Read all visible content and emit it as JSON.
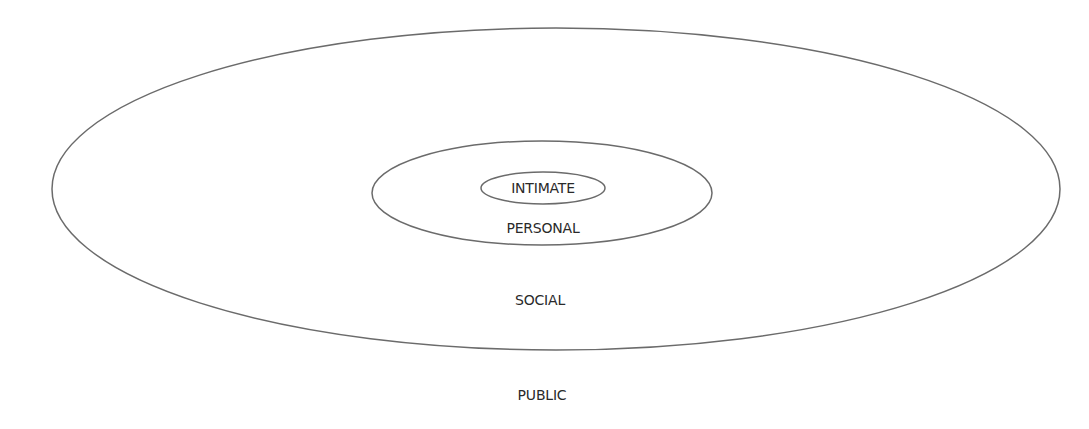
{
  "diagram": {
    "type": "nested-ellipses",
    "stroke_color": "#6b6b6b",
    "zones": [
      {
        "id": "intimate",
        "label": "INTIMATE",
        "ellipse": {
          "cx": 543,
          "cy": 188,
          "rx": 62,
          "ry": 16
        }
      },
      {
        "id": "personal",
        "label": "PERSONAL",
        "ellipse": {
          "cx": 542,
          "cy": 193,
          "rx": 170,
          "ry": 52
        }
      },
      {
        "id": "social",
        "label": "SOCIAL",
        "ellipse": {
          "cx": 556,
          "cy": 189,
          "rx": 504,
          "ry": 161
        }
      },
      {
        "id": "public",
        "label": "PUBLIC"
      }
    ]
  }
}
